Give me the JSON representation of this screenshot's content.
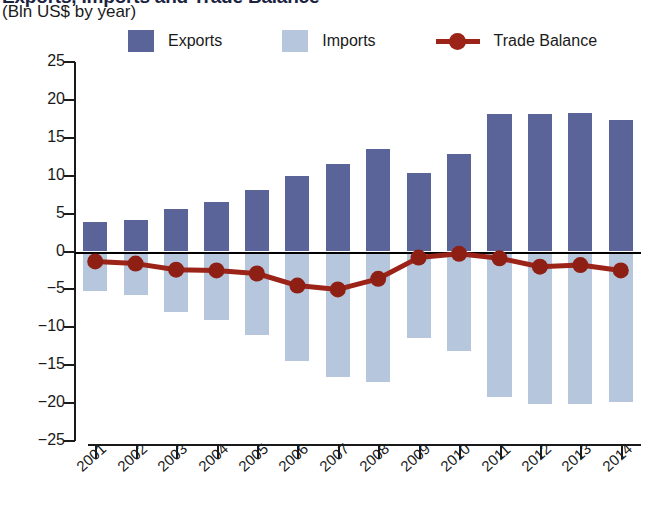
{
  "header": {
    "title": "Exports, Imports and Trade Balance",
    "subtitle": "(Bln US$ by year)"
  },
  "legend": {
    "items": [
      {
        "label": "Exports",
        "marker": "square-swatch",
        "color": "#5a6499"
      },
      {
        "label": "Imports",
        "marker": "square-swatch",
        "color": "#b6c6dc"
      },
      {
        "label": "Trade Balance",
        "marker": "line-with-dot",
        "color": "#9b2318"
      }
    ]
  },
  "chart_data": {
    "type": "bar",
    "title": "Exports, Imports and Trade Balance",
    "subtitle": "(Bln US$ by year)",
    "xlabel": "",
    "ylabel": "",
    "ylim": [
      -25,
      25
    ],
    "yticks": [
      25,
      20,
      15,
      10,
      5,
      0,
      -5,
      -10,
      -15,
      -20,
      -25
    ],
    "ytick_labels": [
      "25",
      "20",
      "15",
      "10",
      "5",
      "0",
      "−5",
      "−10",
      "−15",
      "−20",
      "−25"
    ],
    "grid": false,
    "legend_position": "top",
    "categories": [
      "2001",
      "2002",
      "2003",
      "2004",
      "2005",
      "2006",
      "2007",
      "2008",
      "2009",
      "2010",
      "2011",
      "2012",
      "2013",
      "2014"
    ],
    "series": [
      {
        "name": "Exports",
        "kind": "bar",
        "color": "#5a6499",
        "values": [
          3.9,
          4.2,
          5.6,
          6.5,
          8.1,
          9.9,
          11.6,
          13.5,
          10.4,
          12.8,
          18.2,
          18.2,
          18.3,
          17.4
        ]
      },
      {
        "name": "Imports",
        "kind": "bar",
        "color": "#b6c6dc",
        "values": [
          -5.2,
          -5.8,
          -8.0,
          -9.0,
          -11.0,
          -14.4,
          -16.6,
          -17.2,
          -11.4,
          -13.1,
          -19.2,
          -20.1,
          -20.1,
          -19.8
        ]
      },
      {
        "name": "Trade Balance",
        "kind": "line",
        "color": "#9b2318",
        "values": [
          -1.3,
          -1.6,
          -2.4,
          -2.5,
          -2.9,
          -4.5,
          -5.0,
          -3.6,
          -0.8,
          -0.3,
          -0.9,
          -2.0,
          -1.8,
          -2.5
        ]
      }
    ]
  }
}
